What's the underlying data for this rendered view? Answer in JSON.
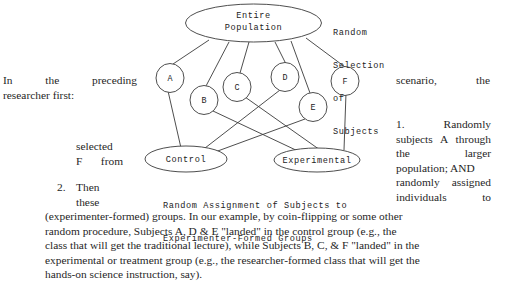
{
  "document": {
    "title": "Random Selection and Random Assignment Diagram"
  },
  "diagram": {
    "population_node": {
      "line1": "Entire",
      "line2": "Population"
    },
    "selection_caption": {
      "line1": "Random",
      "line2": "Selection",
      "line3": "of",
      "line4": "Subjects"
    },
    "subjects": [
      {
        "id": "A",
        "label": "A",
        "group": "Control"
      },
      {
        "id": "B",
        "label": "B",
        "group": "Experimental"
      },
      {
        "id": "C",
        "label": "C",
        "group": "Experimental"
      },
      {
        "id": "D",
        "label": "D",
        "group": "Control"
      },
      {
        "id": "E",
        "label": "E",
        "group": "Control"
      },
      {
        "id": "F",
        "label": "F",
        "group": "Experimental"
      }
    ],
    "control_node": "Control",
    "experimental_node": "Experimental",
    "assignment_caption": {
      "line1": "Random Assignment of Subjects to",
      "line2": "Experimenter-Formed Groups"
    }
  },
  "text": {
    "intro_line1_words": [
      "In",
      "the",
      "preceding"
    ],
    "intro_line2": "researcher first:",
    "intro_right_words": [
      "scenario,",
      "the"
    ],
    "left_mid_line1": "selected",
    "left_mid_line2_words": [
      "F",
      "from"
    ],
    "step2_number": "2.",
    "step2_line1": "Then",
    "step2_line2": "these",
    "right_col_line1_words": [
      "1.",
      "Randomly"
    ],
    "right_col_line2_words": [
      "subjects",
      "A",
      "through"
    ],
    "right_col_line3_words": [
      "the",
      "larger"
    ],
    "right_col_line4": "population; AND",
    "right_col_line5_words": [
      "randomly",
      "assigned"
    ],
    "right_col_line6_words": [
      "individuals",
      "to"
    ],
    "paragraph_lines": [
      "(experimenter-formed) groups. In our example, by coin-flipping or some other",
      "random procedure, Subjects A, D & E \"landed\" in the control group (e.g., the",
      "class that will get the traditional lecture), while Subjects B, C, & F \"landed\" in the",
      "experimental or treatment group (e.g., the researcher-formed class that will get the",
      "hands-on science instruction, say)."
    ]
  },
  "colors": {
    "ink": "#1f1f1f",
    "stroke": "#3a3a3a",
    "paper": "#ffffff"
  }
}
